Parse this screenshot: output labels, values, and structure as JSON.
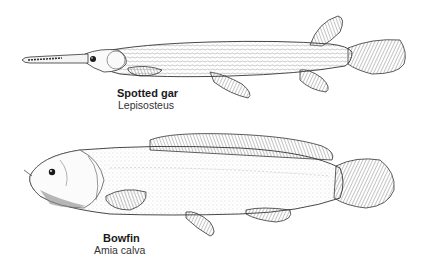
{
  "figure": {
    "specimens": [
      {
        "id": "gar",
        "common_name": "Spotted gar",
        "scientific_name": "Lepisosteus",
        "icon": "spotted-gar-illustration"
      },
      {
        "id": "bowfin",
        "common_name": "Bowfin",
        "scientific_name": "Amia calva",
        "icon": "bowfin-illustration"
      }
    ],
    "colors": {
      "background": "#ffffff",
      "ink": "#1a1a1a",
      "shade": "#777777"
    }
  }
}
